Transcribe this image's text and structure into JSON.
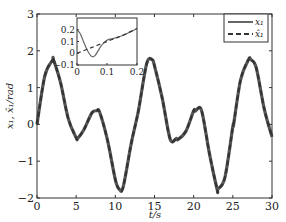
{
  "chart_data": {
    "type": "line",
    "title": "",
    "xlabel": "t/s",
    "ylabel": "x₁, x̂₁/rad",
    "xlim": [
      0,
      30
    ],
    "ylim": [
      -2,
      3
    ],
    "xticks": [
      0,
      5,
      10,
      15,
      20,
      25,
      30
    ],
    "yticks": [
      -2,
      -1,
      0,
      1,
      2,
      3
    ],
    "grid": false,
    "legend_position": "upper right",
    "series": [
      {
        "name": "x₁",
        "style": "solid",
        "color": "#555555",
        "x": [
          0,
          1,
          2,
          2.1,
          3,
          4,
          5,
          5.2,
          6,
          7,
          7.6,
          8,
          9,
          10,
          10.5,
          11,
          12,
          12.57,
          13,
          14,
          14.7,
          15,
          16,
          17,
          17.8,
          18,
          19,
          20,
          20.2,
          21,
          22,
          23,
          23.1,
          24,
          25,
          25.1,
          26,
          27,
          27.3,
          28,
          29,
          30
        ],
        "values": [
          0,
          1.32,
          1.75,
          1.76,
          1.14,
          0.15,
          -0.36,
          -0.38,
          -0.14,
          0.31,
          0.37,
          0.33,
          -0.43,
          -1.5,
          -1.76,
          -1.7,
          -0.55,
          0,
          0.43,
          1.65,
          1.76,
          1.59,
          0.7,
          -0.4,
          -0.38,
          -0.41,
          -0.19,
          0.37,
          0.36,
          0.38,
          -0.78,
          -1.77,
          -1.76,
          -1.43,
          -0.06,
          0.0,
          1.22,
          1.76,
          1.76,
          1.53,
          0.43,
          -0.34
        ]
      },
      {
        "name": "x̂₁",
        "style": "dashed",
        "color": "#333333",
        "x": [
          0,
          1,
          2,
          2.1,
          3,
          4,
          5,
          5.2,
          6,
          7,
          7.6,
          8,
          9,
          10,
          10.5,
          11,
          12,
          12.57,
          13,
          14,
          14.7,
          15,
          16,
          17,
          17.8,
          18,
          19,
          20,
          20.2,
          21,
          22,
          23,
          23.1,
          24,
          25,
          25.1,
          26,
          27,
          27.3,
          28,
          29,
          30
        ],
        "values": [
          0,
          1.32,
          1.75,
          1.76,
          1.14,
          0.15,
          -0.36,
          -0.38,
          -0.14,
          0.31,
          0.37,
          0.33,
          -0.43,
          -1.5,
          -1.76,
          -1.7,
          -0.55,
          0,
          0.43,
          1.65,
          1.76,
          1.59,
          0.7,
          -0.4,
          -0.38,
          -0.41,
          -0.19,
          0.37,
          0.36,
          0.38,
          -0.78,
          -1.77,
          -1.76,
          -1.43,
          -0.06,
          0.0,
          1.22,
          1.76,
          1.76,
          1.53,
          0.43,
          -0.34
        ]
      }
    ],
    "inset": {
      "xlim": [
        0,
        0.2
      ],
      "ylim": [
        -0.1,
        0.3
      ],
      "xticks": [
        0,
        0.1,
        0.2
      ],
      "yticks": [
        -0.1,
        0,
        0.1,
        0.2
      ],
      "series": [
        {
          "name": "x₁",
          "style": "solid",
          "x": [
            0,
            0.01,
            0.02,
            0.03,
            0.04,
            0.05,
            0.06,
            0.07,
            0.08,
            0.09,
            0.1,
            0.11,
            0.12,
            0.14,
            0.16,
            0.18,
            0.2
          ],
          "values": [
            0.2,
            0.17,
            0.11,
            0.05,
            0.0,
            -0.03,
            -0.02,
            0.02,
            0.06,
            0.09,
            0.11,
            0.12,
            0.125,
            0.14,
            0.16,
            0.185,
            0.21
          ]
        },
        {
          "name": "x̂₁",
          "style": "dashed",
          "x": [
            0,
            0.05,
            0.1,
            0.12,
            0.15,
            0.2
          ],
          "values": [
            0.0,
            0.05,
            0.1,
            0.12,
            0.15,
            0.21
          ]
        }
      ]
    }
  },
  "labels": {
    "xlabel": "t/s",
    "ylabel": "x₁, x̂₁/rad",
    "legend": [
      "x₁",
      "x̂₁"
    ],
    "xticks": [
      "0",
      "5",
      "10",
      "15",
      "20",
      "25",
      "30"
    ],
    "yticks": [
      "-2",
      "-1",
      "0",
      "1",
      "2",
      "3"
    ],
    "inset_xticks": [
      "0",
      "0.1",
      "0.2"
    ],
    "inset_yticks": [
      "-0.1",
      "0",
      "0.1",
      "0.2"
    ]
  }
}
